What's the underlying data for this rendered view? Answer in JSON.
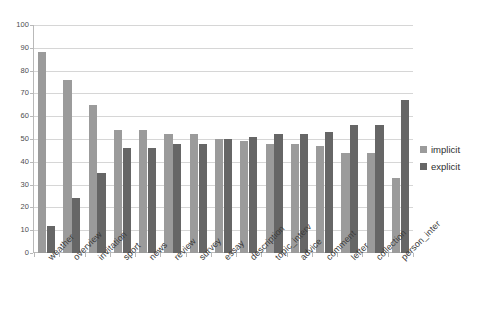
{
  "chart_data": {
    "type": "bar",
    "title": "",
    "xlabel": "",
    "ylabel": "",
    "ylim": [
      0,
      100
    ],
    "ytick_step": 10,
    "grid": true,
    "legend_position": "right",
    "categories": [
      "weather",
      "overview",
      "invitation",
      "sport",
      "news",
      "review",
      "survey",
      "essay",
      "description",
      "topic_interv",
      "advice",
      "comment",
      "letter",
      "collection",
      "person_inter"
    ],
    "yticks": [
      "0",
      "10",
      "20",
      "30",
      "40",
      "50",
      "60",
      "70",
      "80",
      "90",
      "100"
    ],
    "series": [
      {
        "name": "implicit",
        "color": "#9b9b9b",
        "values": [
          88,
          76,
          65,
          54,
          54,
          52,
          52,
          50,
          49,
          48,
          48,
          47,
          44,
          44,
          33
        ]
      },
      {
        "name": "explicit",
        "color": "#666666",
        "values": [
          12,
          24,
          35,
          46,
          46,
          48,
          48,
          50,
          51,
          52,
          52,
          53,
          56,
          56,
          67
        ]
      }
    ]
  },
  "legend": {
    "items": [
      {
        "label": "implicit",
        "color": "#9b9b9b"
      },
      {
        "label": "explicit",
        "color": "#666666"
      }
    ]
  },
  "colors": {
    "implicit": "#9b9b9b",
    "explicit": "#666666",
    "grid": "#d6d6d6",
    "axis": "#b9b9b9",
    "tick_text": "#4d4d4d",
    "category_text": "#3a3a3a",
    "background": "#ffffff"
  }
}
